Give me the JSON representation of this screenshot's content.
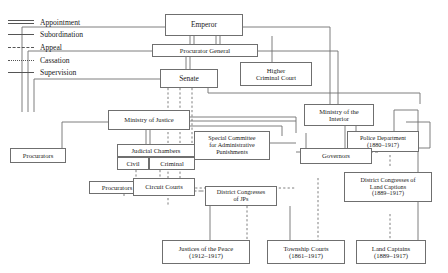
{
  "diagram": {
    "width": 448,
    "height": 273,
    "line_color": "#6f6f6f",
    "text_color": "#1a1a1a",
    "background": "#ffffff"
  },
  "legend": {
    "items": [
      {
        "label": "Appointment",
        "style": "double-solid"
      },
      {
        "label": "Subordination",
        "style": "solid"
      },
      {
        "label": "Appeal",
        "style": "dash-dot"
      },
      {
        "label": "Cassation",
        "style": "dashed"
      },
      {
        "label": "Supervision",
        "style": "solid"
      }
    ]
  },
  "nodes": [
    {
      "id": "emperor",
      "lines": [
        "Emperor"
      ]
    },
    {
      "id": "procurator-general",
      "lines": [
        "Procurator General"
      ]
    },
    {
      "id": "senate",
      "lines": [
        "Senate"
      ]
    },
    {
      "id": "higher-criminal-court",
      "lines": [
        "Higher",
        "Criminal Court"
      ]
    },
    {
      "id": "ministry-of-justice",
      "lines": [
        "Ministry of Justice"
      ]
    },
    {
      "id": "ministry-of-the-interior",
      "lines": [
        "Ministry of the",
        "Interior"
      ]
    },
    {
      "id": "judicial-chambers",
      "lines": [
        "Judicial Chambers"
      ]
    },
    {
      "id": "civil",
      "lines": [
        "Civil"
      ]
    },
    {
      "id": "criminal",
      "lines": [
        "Criminal"
      ]
    },
    {
      "id": "procurators-left",
      "lines": [
        "Procurators"
      ]
    },
    {
      "id": "procurators-lower",
      "lines": [
        "Procurators"
      ]
    },
    {
      "id": "circuit-courts",
      "lines": [
        "Circuit Courts"
      ]
    },
    {
      "id": "special-committee",
      "lines": [
        "Special Committee",
        "for Administrative",
        "Punishments"
      ]
    },
    {
      "id": "police-department",
      "lines": [
        "Police Department",
        "(1880–1917)"
      ]
    },
    {
      "id": "governors",
      "lines": [
        "Governors"
      ]
    },
    {
      "id": "district-congresses-jps",
      "lines": [
        "District Congresses",
        "of JPs"
      ]
    },
    {
      "id": "district-congresses-land-captains",
      "lines": [
        "District Congresses of",
        "Land Captions",
        "(1889–1917)"
      ]
    },
    {
      "id": "justices-of-the-peace",
      "lines": [
        "Justices of the Peace",
        "(1912–1917)"
      ]
    },
    {
      "id": "township-courts",
      "lines": [
        "Township Courts",
        "(1861–1917)"
      ]
    },
    {
      "id": "land-captains",
      "lines": [
        "Land Captains",
        "(1889–1917)"
      ]
    }
  ]
}
